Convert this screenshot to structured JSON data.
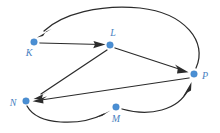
{
  "figure": {
    "kind": "directed-graph",
    "width": 220,
    "height": 133,
    "background_color": "#ffffff",
    "edge_color": "#2b2b2b",
    "vertex_color": "#4a8fd4",
    "label_color": "#4a7fc1"
  },
  "graph_data": {
    "type": "diagram",
    "directed": true,
    "vertices": [
      {
        "id": "K",
        "label": "K",
        "x": 34,
        "y": 42,
        "label_x": 29,
        "label_y": 56
      },
      {
        "id": "L",
        "label": "L",
        "x": 110,
        "y": 45,
        "label_x": 113,
        "label_y": 36
      },
      {
        "id": "P",
        "label": "P",
        "x": 194,
        "y": 74,
        "label_x": 204,
        "label_y": 79
      },
      {
        "id": "N",
        "label": "N",
        "x": 26,
        "y": 101,
        "label_x": 13,
        "label_y": 106
      },
      {
        "id": "M",
        "label": "M",
        "x": 116,
        "y": 107,
        "label_x": 113,
        "label_y": 122
      }
    ],
    "edges": [
      {
        "id": "K-L",
        "from": "K",
        "to": "L",
        "shape": "straight",
        "label": "K to L"
      },
      {
        "id": "L-P",
        "from": "L",
        "to": "P",
        "shape": "straight",
        "label": "L to P"
      },
      {
        "id": "L-N",
        "from": "L",
        "to": "N",
        "shape": "straight",
        "label": "L to N"
      },
      {
        "id": "P-N",
        "from": "P",
        "to": "N",
        "shape": "straight",
        "label": "P to N"
      },
      {
        "id": "P-K",
        "from": "P",
        "to": "K",
        "shape": "curved-over-top",
        "label": "P to K"
      },
      {
        "id": "N-M",
        "from": "N",
        "to": "M",
        "shape": "curved-below",
        "label": "N to M"
      },
      {
        "id": "M-P",
        "from": "M",
        "to": "P",
        "shape": "curved-right",
        "label": "M to P"
      }
    ]
  }
}
